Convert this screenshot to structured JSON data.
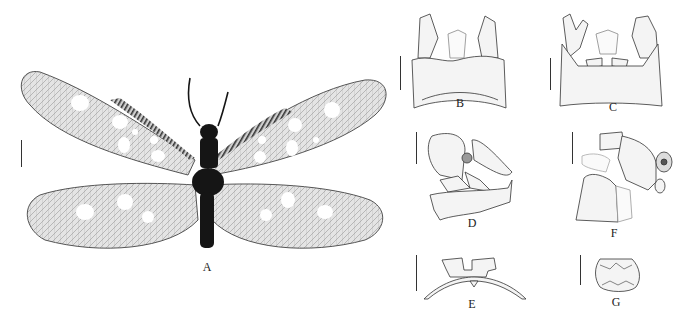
{
  "figure": {
    "panels": [
      {
        "id": "A",
        "label": "A",
        "kind": "photograph",
        "subject": "adult specimen, dorsal view, wings spread"
      },
      {
        "id": "B",
        "label": "B",
        "kind": "line-drawing",
        "subject": "genitalia, dorsal view"
      },
      {
        "id": "C",
        "label": "C",
        "kind": "line-drawing",
        "subject": "genitalia, ventral view"
      },
      {
        "id": "D",
        "label": "D",
        "kind": "line-drawing",
        "subject": "genitalia, lateral view"
      },
      {
        "id": "E",
        "label": "E",
        "kind": "line-drawing",
        "subject": "structure, caudal view"
      },
      {
        "id": "F",
        "label": "F",
        "kind": "line-drawing",
        "subject": "terminalia, lateral view"
      },
      {
        "id": "G",
        "label": "G",
        "kind": "line-drawing",
        "subject": "plate, ventral view"
      }
    ],
    "colors": {
      "background": "#ffffff",
      "ink": "#222222",
      "wing_membrane": "#d8d8d8",
      "body": "#151515",
      "spot": "#ffffff"
    }
  }
}
